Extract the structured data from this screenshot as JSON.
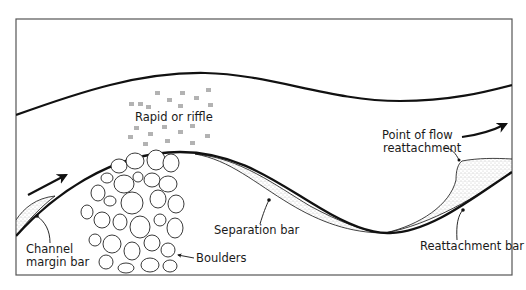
{
  "diagram": {
    "frame": {
      "x": 16,
      "y": 19,
      "width": 496,
      "height": 256,
      "stroke": "#555555"
    },
    "colors": {
      "line": "#111111",
      "stipple": "#8a8a8a",
      "background": "#ffffff"
    },
    "labels": {
      "rapid": "Rapid or riffle",
      "reattach_point_line1": "Point of flow",
      "reattach_point_line2": "reattachment",
      "separation_bar": "Separation bar",
      "reattachment_bar": "Reattachment bar",
      "channel_margin_line1": "Channel",
      "channel_margin_line2": "margin bar",
      "boulders": "Boulders"
    },
    "flow_arrows": [
      {
        "name": "flow-direction-left",
        "from": [
          28,
          195
        ],
        "to": [
          68,
          174
        ]
      },
      {
        "name": "flow-direction-right",
        "from": [
          462,
          137
        ],
        "to": [
          508,
          124
        ]
      }
    ]
  }
}
